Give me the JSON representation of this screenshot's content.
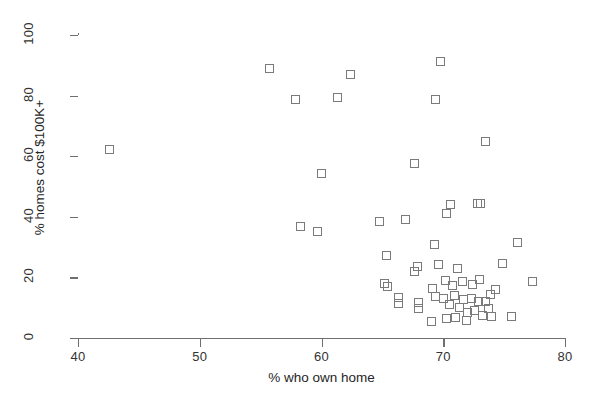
{
  "chart_data": {
    "type": "scatter",
    "title": "",
    "xlabel": "% who own home",
    "ylabel": "% homes cost $100K+",
    "xlim": [
      40,
      80
    ],
    "ylim": [
      0,
      100
    ],
    "xticks": [
      40,
      50,
      60,
      70,
      80
    ],
    "yticks": [
      0,
      20,
      40,
      60,
      80,
      100
    ],
    "grid": false,
    "legend": null,
    "marker": {
      "shape": "open-square",
      "color": "#7a7a7a",
      "size_px": 9
    },
    "series": [
      {
        "name": "states",
        "points": [
          [
            42.6,
            62.3
          ],
          [
            55.7,
            89.0
          ],
          [
            57.9,
            78.6
          ],
          [
            62.4,
            87.1
          ],
          [
            61.3,
            79.4
          ],
          [
            69.8,
            91.2
          ],
          [
            69.4,
            78.8
          ],
          [
            73.5,
            65.0
          ],
          [
            60.0,
            54.2
          ],
          [
            67.6,
            57.5
          ],
          [
            58.3,
            36.8
          ],
          [
            59.7,
            35.0
          ],
          [
            64.8,
            38.6
          ],
          [
            66.9,
            39.1
          ],
          [
            72.8,
            44.5
          ],
          [
            73.1,
            44.3
          ],
          [
            76.1,
            31.5
          ],
          [
            69.3,
            31.0
          ],
          [
            65.3,
            27.2
          ],
          [
            67.9,
            23.5
          ],
          [
            67.6,
            21.9
          ],
          [
            69.6,
            24.4
          ],
          [
            71.2,
            22.9
          ],
          [
            74.9,
            24.5
          ],
          [
            77.3,
            18.8
          ],
          [
            65.2,
            18.0
          ],
          [
            65.4,
            16.9
          ],
          [
            69.1,
            16.2
          ],
          [
            70.2,
            19.0
          ],
          [
            70.8,
            17.3
          ],
          [
            71.6,
            18.5
          ],
          [
            72.4,
            17.8
          ],
          [
            73.0,
            19.4
          ],
          [
            74.3,
            16.0
          ],
          [
            68.0,
            11.8
          ],
          [
            68.0,
            9.6
          ],
          [
            69.0,
            5.5
          ],
          [
            69.4,
            13.6
          ],
          [
            70.0,
            13.0
          ],
          [
            70.5,
            11.2
          ],
          [
            70.9,
            14.0
          ],
          [
            71.3,
            10.1
          ],
          [
            71.7,
            12.6
          ],
          [
            72.0,
            8.4
          ],
          [
            72.3,
            13.2
          ],
          [
            72.6,
            9.0
          ],
          [
            72.9,
            11.9
          ],
          [
            73.2,
            7.4
          ],
          [
            73.5,
            12.1
          ],
          [
            73.7,
            9.8
          ],
          [
            74.0,
            7.0
          ],
          [
            70.3,
            6.3
          ],
          [
            71.0,
            6.8
          ],
          [
            71.9,
            5.9
          ],
          [
            73.9,
            14.3
          ],
          [
            75.6,
            7.1
          ],
          [
            66.3,
            13.5
          ],
          [
            66.3,
            11.4
          ],
          [
            70.6,
            44.0
          ],
          [
            70.3,
            41.0
          ]
        ]
      }
    ]
  },
  "axes": {
    "y_title": "% homes cost $100K+",
    "x_title": "% who own home",
    "y_tick_labels": [
      "0",
      "20",
      "40",
      "60",
      "80",
      "100"
    ],
    "x_tick_labels": [
      "40",
      "50",
      "60",
      "70",
      "80"
    ]
  }
}
